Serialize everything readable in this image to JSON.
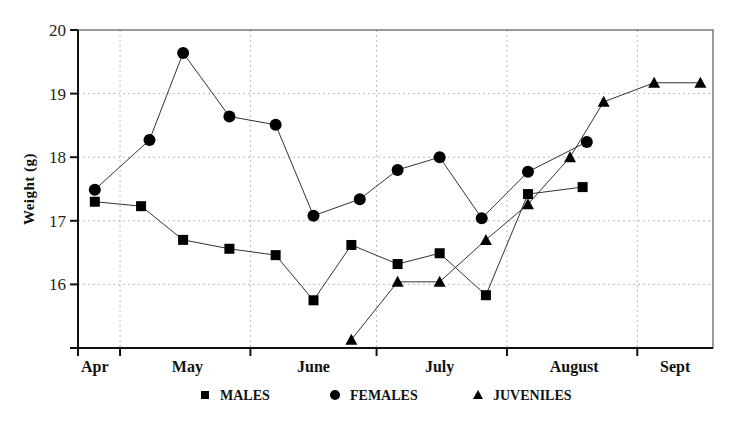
{
  "chart_data": {
    "type": "line",
    "title": "",
    "xlabel": "",
    "ylabel": "Weight (g)",
    "x_unit": "day of year",
    "xlim": [
      111,
      262
    ],
    "ylim": [
      15,
      20
    ],
    "yticks": [
      16,
      17,
      18,
      19,
      20
    ],
    "grid": true,
    "month_boundaries": [
      121,
      152,
      182,
      213,
      244
    ],
    "month_labels": [
      {
        "label": "Apr",
        "center": 115
      },
      {
        "label": "May",
        "center": 137
      },
      {
        "label": "June",
        "center": 167
      },
      {
        "label": "July",
        "center": 197
      },
      {
        "label": "August",
        "center": 229
      },
      {
        "label": "Sept",
        "center": 253
      }
    ],
    "legend_position": "bottom",
    "series": [
      {
        "name": "MALES",
        "marker": "square",
        "x": [
          115,
          126,
          136,
          147,
          158,
          167,
          176,
          187,
          197,
          208,
          218,
          231
        ],
        "values": [
          17.3,
          17.23,
          16.7,
          16.56,
          16.46,
          15.75,
          16.62,
          16.32,
          16.49,
          15.83,
          17.42,
          17.53
        ]
      },
      {
        "name": "FEMALES",
        "marker": "circle",
        "x": [
          115,
          128,
          136,
          147,
          158,
          167,
          178,
          187,
          197,
          207,
          218,
          232
        ],
        "values": [
          17.49,
          18.27,
          19.64,
          18.64,
          18.51,
          17.08,
          17.34,
          17.8,
          18.0,
          17.04,
          17.77,
          18.24
        ]
      },
      {
        "name": "JUVENILES",
        "marker": "triangle",
        "x": [
          176,
          187,
          197,
          208,
          218,
          228,
          236,
          248,
          259
        ],
        "values": [
          15.13,
          16.04,
          16.04,
          16.7,
          17.26,
          18.0,
          18.87,
          19.17,
          19.17
        ]
      }
    ]
  }
}
